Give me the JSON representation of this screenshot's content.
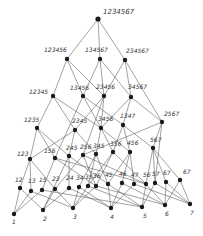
{
  "diagram": {
    "type": "hasse-lattice",
    "nodes": [
      {
        "id": "1234567",
        "label": "1234567",
        "x": 98,
        "y": 19,
        "lx": 103,
        "ly": 14,
        "big": true
      },
      {
        "id": "123456",
        "label": "123456",
        "x": 67,
        "y": 59,
        "lx": 44,
        "ly": 52
      },
      {
        "id": "134567",
        "label": "134567",
        "x": 100,
        "y": 59,
        "lx": 85,
        "ly": 52
      },
      {
        "id": "234567",
        "label": "234567",
        "x": 125,
        "y": 60,
        "lx": 126,
        "ly": 53
      },
      {
        "id": "12345",
        "label": "12345",
        "x": 53,
        "y": 96,
        "lx": 29,
        "ly": 94
      },
      {
        "id": "13456",
        "label": "13456",
        "x": 83,
        "y": 96,
        "lx": 70,
        "ly": 90
      },
      {
        "id": "23456",
        "label": "23456",
        "x": 104,
        "y": 96,
        "lx": 96,
        "ly": 89
      },
      {
        "id": "34567",
        "label": "34567",
        "x": 131,
        "y": 97,
        "lx": 128,
        "ly": 89
      },
      {
        "id": "1235",
        "label": "1235",
        "x": 37,
        "y": 128,
        "lx": 24,
        "ly": 122
      },
      {
        "id": "2345",
        "label": "2345",
        "x": 75,
        "y": 130,
        "lx": 72,
        "ly": 123
      },
      {
        "id": "3456",
        "label": "3456",
        "x": 101,
        "y": 128,
        "lx": 98,
        "ly": 121
      },
      {
        "id": "1347",
        "label": "1347",
        "x": 123,
        "y": 125,
        "lx": 120,
        "ly": 118
      },
      {
        "id": "2567",
        "label": "2567",
        "x": 162,
        "y": 122,
        "lx": 164,
        "ly": 116
      },
      {
        "id": "123",
        "label": "123",
        "x": 30,
        "y": 159,
        "lx": 17,
        "ly": 156
      },
      {
        "id": "156",
        "label": "156",
        "x": 55,
        "y": 158,
        "lx": 44,
        "ly": 153
      },
      {
        "id": "245",
        "label": "245",
        "x": 69,
        "y": 156,
        "lx": 66,
        "ly": 150
      },
      {
        "id": "256",
        "label": "256",
        "x": 83,
        "y": 155,
        "lx": 80,
        "ly": 149
      },
      {
        "id": "345",
        "label": "345",
        "x": 96,
        "y": 154,
        "lx": 93,
        "ly": 148
      },
      {
        "id": "356",
        "label": "356",
        "x": 113,
        "y": 152,
        "lx": 110,
        "ly": 146
      },
      {
        "id": "456",
        "label": "456",
        "x": 130,
        "y": 152,
        "lx": 127,
        "ly": 145
      },
      {
        "id": "567",
        "label": "567",
        "x": 153,
        "y": 148,
        "lx": 150,
        "ly": 142
      },
      {
        "id": "12",
        "label": "12",
        "x": 20,
        "y": 188,
        "lx": 15,
        "ly": 182
      },
      {
        "id": "13",
        "label": "13",
        "x": 31,
        "y": 191,
        "lx": 28,
        "ly": 183
      },
      {
        "id": "15",
        "label": "15",
        "x": 42,
        "y": 190,
        "lx": 39,
        "ly": 182
      },
      {
        "id": "23",
        "label": "23",
        "x": 55,
        "y": 189,
        "lx": 52,
        "ly": 181
      },
      {
        "id": "24",
        "label": "24",
        "x": 69,
        "y": 188,
        "lx": 66,
        "ly": 180
      },
      {
        "id": "34",
        "label": "34",
        "x": 79,
        "y": 187,
        "lx": 76,
        "ly": 180
      },
      {
        "id": "35",
        "label": "35",
        "x": 88,
        "y": 186,
        "lx": 85,
        "ly": 179
      },
      {
        "id": "36",
        "label": "36",
        "x": 96,
        "y": 186,
        "lx": 93,
        "ly": 178
      },
      {
        "id": "45",
        "label": "45",
        "x": 108,
        "y": 184,
        "lx": 105,
        "ly": 177
      },
      {
        "id": "46",
        "label": "46",
        "x": 122,
        "y": 183,
        "lx": 119,
        "ly": 176
      },
      {
        "id": "47",
        "label": "47",
        "x": 134,
        "y": 184,
        "lx": 131,
        "ly": 177
      },
      {
        "id": "56",
        "label": "56",
        "x": 146,
        "y": 184,
        "lx": 143,
        "ly": 177
      },
      {
        "id": "57",
        "label": "57",
        "x": 155,
        "y": 183,
        "lx": 152,
        "ly": 176
      },
      {
        "id": "67",
        "label": "67",
        "x": 166,
        "y": 182,
        "lx": 163,
        "ly": 175
      },
      {
        "id": "67b",
        "label": "67",
        "x": 180,
        "y": 180,
        "lx": 183,
        "ly": 174
      },
      {
        "id": "1",
        "label": "1",
        "x": 14,
        "y": 214,
        "lx": 12,
        "ly": 224
      },
      {
        "id": "2",
        "label": "2",
        "x": 43,
        "y": 210,
        "lx": 43,
        "ly": 221
      },
      {
        "id": "3",
        "label": "3",
        "x": 73,
        "y": 208,
        "lx": 73,
        "ly": 219
      },
      {
        "id": "4",
        "label": "4",
        "x": 111,
        "y": 208,
        "lx": 110,
        "ly": 219
      },
      {
        "id": "5",
        "label": "5",
        "x": 142,
        "y": 207,
        "lx": 143,
        "ly": 218
      },
      {
        "id": "6",
        "label": "6",
        "x": 165,
        "y": 205,
        "lx": 165,
        "ly": 216
      },
      {
        "id": "7",
        "label": "7",
        "x": 190,
        "y": 204,
        "lx": 190,
        "ly": 215
      }
    ],
    "edges": [
      [
        "1234567",
        "123456"
      ],
      [
        "1234567",
        "134567"
      ],
      [
        "1234567",
        "234567"
      ],
      [
        "123456",
        "12345"
      ],
      [
        "123456",
        "13456"
      ],
      [
        "123456",
        "23456"
      ],
      [
        "134567",
        "13456"
      ],
      [
        "134567",
        "34567"
      ],
      [
        "134567",
        "23456"
      ],
      [
        "234567",
        "23456"
      ],
      [
        "234567",
        "34567"
      ],
      [
        "234567",
        "2567"
      ],
      [
        "12345",
        "1235"
      ],
      [
        "12345",
        "2345"
      ],
      [
        "12345",
        "3456"
      ],
      [
        "13456",
        "3456"
      ],
      [
        "13456",
        "1347"
      ],
      [
        "13456",
        "156"
      ],
      [
        "23456",
        "2345"
      ],
      [
        "23456",
        "3456"
      ],
      [
        "23456",
        "256"
      ],
      [
        "34567",
        "1347"
      ],
      [
        "34567",
        "2567"
      ],
      [
        "34567",
        "3456"
      ],
      [
        "1235",
        "123"
      ],
      [
        "1235",
        "156"
      ],
      [
        "1235",
        "245"
      ],
      [
        "2345",
        "245"
      ],
      [
        "2345",
        "345"
      ],
      [
        "2345",
        "123"
      ],
      [
        "3456",
        "345"
      ],
      [
        "3456",
        "356"
      ],
      [
        "3456",
        "456"
      ],
      [
        "1347",
        "456"
      ],
      [
        "1347",
        "567"
      ],
      [
        "1347",
        "356"
      ],
      [
        "2567",
        "567"
      ],
      [
        "2567",
        "256"
      ],
      [
        "2567",
        "57"
      ],
      [
        "123",
        "12"
      ],
      [
        "123",
        "13"
      ],
      [
        "123",
        "23"
      ],
      [
        "156",
        "15"
      ],
      [
        "156",
        "56"
      ],
      [
        "156",
        "36"
      ],
      [
        "245",
        "24"
      ],
      [
        "245",
        "45"
      ],
      [
        "245",
        "2"
      ],
      [
        "256",
        "23"
      ],
      [
        "256",
        "56"
      ],
      [
        "256",
        "36"
      ],
      [
        "345",
        "34"
      ],
      [
        "345",
        "35"
      ],
      [
        "345",
        "45"
      ],
      [
        "356",
        "35"
      ],
      [
        "356",
        "36"
      ],
      [
        "356",
        "56"
      ],
      [
        "456",
        "45"
      ],
      [
        "456",
        "46"
      ],
      [
        "456",
        "47"
      ],
      [
        "567",
        "56"
      ],
      [
        "567",
        "57"
      ],
      [
        "567",
        "67"
      ],
      [
        "567",
        "67b"
      ],
      [
        "12",
        "1"
      ],
      [
        "12",
        "2"
      ],
      [
        "13",
        "1"
      ],
      [
        "13",
        "3"
      ],
      [
        "15",
        "1"
      ],
      [
        "15",
        "5"
      ],
      [
        "23",
        "2"
      ],
      [
        "23",
        "3"
      ],
      [
        "24",
        "2"
      ],
      [
        "24",
        "4"
      ],
      [
        "34",
        "3"
      ],
      [
        "34",
        "4"
      ],
      [
        "35",
        "3"
      ],
      [
        "35",
        "5"
      ],
      [
        "36",
        "3"
      ],
      [
        "36",
        "6"
      ],
      [
        "45",
        "4"
      ],
      [
        "45",
        "5"
      ],
      [
        "46",
        "4"
      ],
      [
        "46",
        "6"
      ],
      [
        "47",
        "4"
      ],
      [
        "47",
        "7"
      ],
      [
        "56",
        "5"
      ],
      [
        "56",
        "6"
      ],
      [
        "57",
        "5"
      ],
      [
        "57",
        "7"
      ],
      [
        "67",
        "6"
      ],
      [
        "67",
        "7"
      ],
      [
        "67b",
        "6"
      ],
      [
        "67b",
        "7"
      ]
    ]
  }
}
